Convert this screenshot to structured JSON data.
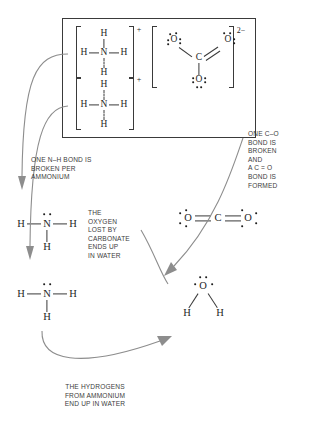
{
  "diagram": {
    "box_label": "reactants-box"
  },
  "reactants": {
    "ammonium_1": {
      "center": "N",
      "h_left": "H",
      "h_right": "H",
      "h_top": "H",
      "h_bottom": "H",
      "charge": "+"
    },
    "ammonium_2": {
      "center": "N",
      "h_left": "H",
      "h_right": "H",
      "h_top": "H",
      "h_bottom": "H",
      "charge": "+"
    },
    "carbonate": {
      "center": "C",
      "o_left": "O",
      "o_right": "O",
      "o_bottom": "O",
      "charge": "2−"
    }
  },
  "products": {
    "ammonia_1": {
      "center": "N",
      "h_left": "H",
      "h_right": "H",
      "h_bottom": "H"
    },
    "ammonia_2": {
      "center": "N",
      "h_left": "H",
      "h_right": "H",
      "h_bottom": "H"
    },
    "carbon_dioxide": {
      "center": "C",
      "o_left": "O",
      "o_right": "O"
    },
    "water": {
      "center": "O",
      "h_left": "H",
      "h_right": "H"
    }
  },
  "annotations": {
    "left": "ONE N–H BOND IS\nBROKEN PER\nAMMONIUM",
    "right": "ONE C–O\nBOND IS\nBROKEN\nAND\nA C = O\nBOND IS\nFORMED",
    "middle": "THE\nOXYGEN\nLOST BY\nCARBONATE\nENDS UP\nIN WATER",
    "bottom": "THE HYDROGENS\nFROM AMMONIUM\nEND UP IN WATER"
  },
  "colors": {
    "ink": "#2b2b2b",
    "bond": "#3a3a3a",
    "arrow": "#8d8d8d",
    "background": "#ffffff"
  }
}
